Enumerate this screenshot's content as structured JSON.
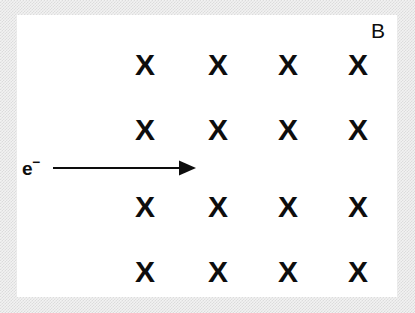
{
  "figure": {
    "kind": "physics-diagram",
    "panel_background": "#ffffff",
    "ink_color": "#0d0d0d",
    "border_texture_color": "#dcdcdc"
  },
  "labels": {
    "field_label": "B",
    "particle_symbol": "e",
    "particle_charge": "−"
  },
  "field_grid": {
    "symbol": "X",
    "meaning": "magnetic field into the page",
    "rows": 4,
    "columns": 4,
    "column_x": [
      145,
      218,
      288,
      358
    ],
    "row_y": [
      65,
      130,
      207,
      272
    ],
    "marks": [
      {
        "row": 1,
        "col": 1,
        "x": 145,
        "y": 65,
        "glyph": "X"
      },
      {
        "row": 1,
        "col": 2,
        "x": 218,
        "y": 65,
        "glyph": "X"
      },
      {
        "row": 1,
        "col": 3,
        "x": 288,
        "y": 65,
        "glyph": "X"
      },
      {
        "row": 1,
        "col": 4,
        "x": 358,
        "y": 65,
        "glyph": "X"
      },
      {
        "row": 2,
        "col": 1,
        "x": 145,
        "y": 130,
        "glyph": "X"
      },
      {
        "row": 2,
        "col": 2,
        "x": 218,
        "y": 130,
        "glyph": "X"
      },
      {
        "row": 2,
        "col": 3,
        "x": 288,
        "y": 130,
        "glyph": "X"
      },
      {
        "row": 2,
        "col": 4,
        "x": 358,
        "y": 130,
        "glyph": "X"
      },
      {
        "row": 3,
        "col": 1,
        "x": 145,
        "y": 207,
        "glyph": "X"
      },
      {
        "row": 3,
        "col": 2,
        "x": 218,
        "y": 207,
        "glyph": "X"
      },
      {
        "row": 3,
        "col": 3,
        "x": 288,
        "y": 207,
        "glyph": "X"
      },
      {
        "row": 3,
        "col": 4,
        "x": 358,
        "y": 207,
        "glyph": "X"
      },
      {
        "row": 4,
        "col": 1,
        "x": 145,
        "y": 272,
        "glyph": "X"
      },
      {
        "row": 4,
        "col": 2,
        "x": 218,
        "y": 272,
        "glyph": "X"
      },
      {
        "row": 4,
        "col": 3,
        "x": 288,
        "y": 272,
        "glyph": "X"
      },
      {
        "row": 4,
        "col": 4,
        "x": 358,
        "y": 272,
        "glyph": "X"
      }
    ]
  },
  "velocity_arrow": {
    "direction": "right",
    "x_start": 53,
    "x_end": 196,
    "y": 168
  },
  "label_positions": {
    "field_label": {
      "x": 378,
      "y": 30
    },
    "particle_label": {
      "x": 22,
      "y": 168
    }
  }
}
